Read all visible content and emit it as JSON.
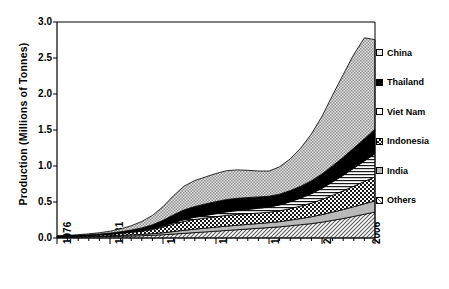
{
  "chart_data": {
    "type": "area",
    "title": "",
    "subtitle": "",
    "xlabel": "",
    "ylabel": "Production (Millions of Tonnes)",
    "stacked": true,
    "grid": false,
    "legend_position": "right",
    "xlim": [
      1976,
      2006
    ],
    "ylim": [
      0.0,
      3.0
    ],
    "ytick_labels": [
      "3.0",
      "2.5",
      "2.0",
      "1.5",
      "1.0",
      "0.5",
      "0.0"
    ],
    "ytick_values": [
      3.0,
      2.5,
      2.0,
      1.5,
      1.0,
      0.5,
      0.0
    ],
    "xtick_labels": [
      "1976",
      "1981",
      "1986",
      "1991",
      "1996",
      "2001",
      "2006"
    ],
    "xtick_values": [
      1976,
      1981,
      1986,
      1991,
      1996,
      2001,
      2006
    ],
    "x": [
      1976,
      1977,
      1978,
      1979,
      1980,
      1981,
      1982,
      1983,
      1984,
      1985,
      1986,
      1987,
      1988,
      1989,
      1990,
      1991,
      1992,
      1993,
      1994,
      1995,
      1996,
      1997,
      1998,
      1999,
      2000,
      2001,
      2002,
      2003,
      2004,
      2005,
      2006
    ],
    "series": [
      {
        "name": "Others",
        "pattern": "diagonal-hatch",
        "values": [
          0.01,
          0.012,
          0.014,
          0.016,
          0.018,
          0.02,
          0.024,
          0.028,
          0.032,
          0.038,
          0.045,
          0.055,
          0.065,
          0.075,
          0.085,
          0.095,
          0.105,
          0.115,
          0.125,
          0.135,
          0.145,
          0.155,
          0.17,
          0.185,
          0.2,
          0.22,
          0.245,
          0.27,
          0.3,
          0.33,
          0.36
        ]
      },
      {
        "name": "India",
        "pattern": "light-gray-solid",
        "values": [
          0.005,
          0.006,
          0.007,
          0.008,
          0.01,
          0.012,
          0.014,
          0.016,
          0.018,
          0.022,
          0.028,
          0.035,
          0.042,
          0.048,
          0.052,
          0.056,
          0.06,
          0.062,
          0.064,
          0.066,
          0.068,
          0.072,
          0.078,
          0.085,
          0.095,
          0.105,
          0.115,
          0.125,
          0.135,
          0.145,
          0.155
        ]
      },
      {
        "name": "Indonesia",
        "pattern": "checkerboard",
        "values": [
          0.006,
          0.008,
          0.01,
          0.013,
          0.016,
          0.02,
          0.026,
          0.034,
          0.044,
          0.058,
          0.078,
          0.105,
          0.125,
          0.135,
          0.14,
          0.145,
          0.15,
          0.15,
          0.148,
          0.146,
          0.145,
          0.15,
          0.16,
          0.175,
          0.19,
          0.21,
          0.235,
          0.26,
          0.285,
          0.31,
          0.335
        ]
      },
      {
        "name": "Viet Nam",
        "pattern": "horizontal-lines",
        "values": [
          0.001,
          0.001,
          0.002,
          0.002,
          0.003,
          0.004,
          0.005,
          0.006,
          0.008,
          0.01,
          0.014,
          0.018,
          0.024,
          0.03,
          0.036,
          0.042,
          0.048,
          0.054,
          0.06,
          0.066,
          0.072,
          0.082,
          0.095,
          0.11,
          0.13,
          0.155,
          0.185,
          0.215,
          0.25,
          0.285,
          0.32
        ]
      },
      {
        "name": "Thailand",
        "pattern": "solid-black",
        "values": [
          0.002,
          0.003,
          0.004,
          0.006,
          0.008,
          0.012,
          0.018,
          0.026,
          0.038,
          0.055,
          0.08,
          0.11,
          0.135,
          0.15,
          0.16,
          0.168,
          0.172,
          0.17,
          0.165,
          0.158,
          0.15,
          0.15,
          0.155,
          0.165,
          0.18,
          0.2,
          0.225,
          0.25,
          0.28,
          0.31,
          0.34
        ]
      },
      {
        "name": "China",
        "pattern": "fine-stipple",
        "values": [
          0.004,
          0.006,
          0.009,
          0.013,
          0.018,
          0.026,
          0.04,
          0.06,
          0.09,
          0.13,
          0.19,
          0.265,
          0.33,
          0.36,
          0.375,
          0.39,
          0.4,
          0.395,
          0.378,
          0.36,
          0.35,
          0.38,
          0.44,
          0.53,
          0.65,
          0.8,
          0.98,
          1.15,
          1.3,
          1.4,
          1.245
        ]
      }
    ],
    "totals": [
      0.028,
      0.036,
      0.046,
      0.058,
      0.073,
      0.094,
      0.127,
      0.17,
      0.23,
      0.313,
      0.435,
      0.588,
      0.721,
      0.798,
      0.848,
      0.896,
      0.935,
      0.946,
      0.94,
      0.931,
      0.93,
      0.989,
      1.098,
      1.25,
      1.445,
      1.69,
      1.985,
      2.27,
      2.55,
      2.78,
      2.755
    ]
  },
  "legend": {
    "items": [
      {
        "label": "China",
        "pattern": "fine-stipple"
      },
      {
        "label": "Thailand",
        "pattern": "solid-black"
      },
      {
        "label": "Viet Nam",
        "pattern": "light-gray-solid"
      },
      {
        "label": "Indonesia",
        "pattern": "checkerboard"
      },
      {
        "label": "India",
        "pattern": "light-gray-solid"
      },
      {
        "label": "Others",
        "pattern": "diagonal-hatch"
      }
    ]
  },
  "axes": {
    "y_title": "Production (Millions of Tonnes)"
  },
  "caption": {
    "text": ""
  }
}
